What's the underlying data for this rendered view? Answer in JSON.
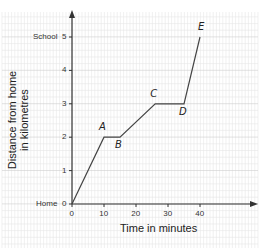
{
  "chart_data": {
    "type": "line",
    "title": "",
    "xlabel": "Time in minutes",
    "ylabel": "Distance from home in kilometres",
    "ylabel_lines": [
      "Distance from home",
      "in kilometres"
    ],
    "xlim": [
      0,
      55
    ],
    "ylim": [
      0,
      5.6
    ],
    "x_ticks": [
      "0",
      "10",
      "20",
      "30",
      "40"
    ],
    "y_ticks": [
      "0",
      "1",
      "2",
      "3",
      "4",
      "5"
    ],
    "y_tick_names": {
      "home": "Home",
      "school": "School"
    },
    "grid": true,
    "series": [
      {
        "name": "Journey",
        "points": [
          {
            "label": "",
            "x": 0,
            "y": 0
          },
          {
            "label": "A",
            "x": 10,
            "y": 2
          },
          {
            "label": "B",
            "x": 15,
            "y": 2
          },
          {
            "label": "C",
            "x": 26,
            "y": 3
          },
          {
            "label": "D",
            "x": 35,
            "y": 3
          },
          {
            "label": "E",
            "x": 40,
            "y": 5
          }
        ]
      }
    ]
  },
  "colors": {
    "grid_minor": "#e6e6e6",
    "grid_major": "#cfcfcf",
    "axis": "#333333",
    "line": "#444444"
  }
}
